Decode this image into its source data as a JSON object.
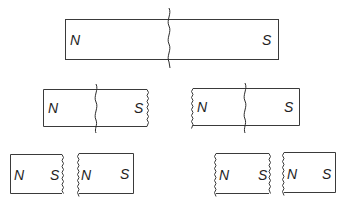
{
  "diagram": {
    "colors": {
      "stroke": "#3a3a3a",
      "text": "#1e1e1e",
      "background": "#ffffff"
    },
    "rows": [
      {
        "level": 1,
        "magnets": [
          {
            "id": "m1",
            "north": "N",
            "south": "S",
            "crack": true
          }
        ]
      },
      {
        "level": 2,
        "magnets": [
          {
            "id": "m2a",
            "north": "N",
            "south": "S",
            "crack": true,
            "broken_edge": "right"
          },
          {
            "id": "m2b",
            "north": "N",
            "south": "S",
            "crack": true,
            "broken_edge": "left"
          }
        ]
      },
      {
        "level": 3,
        "magnets": [
          {
            "id": "m3a",
            "north": "N",
            "south": "S",
            "broken_edge": "right"
          },
          {
            "id": "m3b",
            "north": "N",
            "south": "S",
            "broken_edge": "left"
          },
          {
            "id": "m3c",
            "north": "N",
            "south": "S",
            "broken_edge": "both"
          },
          {
            "id": "m3d",
            "north": "N",
            "south": "S",
            "broken_edge": "left"
          }
        ]
      }
    ]
  }
}
